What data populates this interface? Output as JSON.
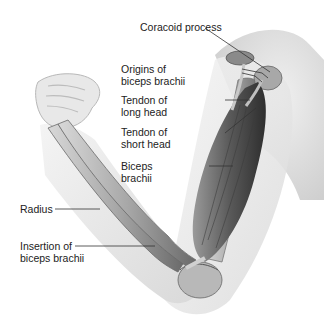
{
  "figure": {
    "labels": {
      "coracoid": "Coracoid process",
      "origins_1": "Origins of",
      "origins_2": "biceps brachii",
      "tendon_long_1": "Tendon of",
      "tendon_long_2": "long head",
      "tendon_short_1": "Tendon of",
      "tendon_short_2": "short head",
      "biceps_1": "Biceps",
      "biceps_2": "brachii",
      "radius": "Radius",
      "insertion_1": "Insertion of",
      "insertion_2": "biceps brachii"
    }
  }
}
